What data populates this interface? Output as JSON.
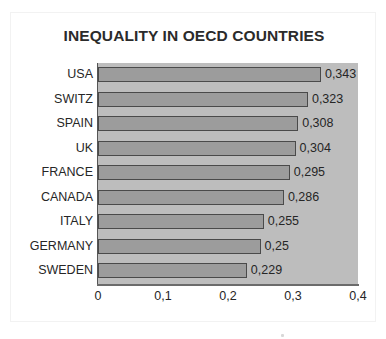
{
  "chart_data": {
    "type": "bar",
    "orientation": "horizontal",
    "title": "INEQUALITY IN OECD COUNTRIES",
    "xlabel": "",
    "ylabel": "",
    "categories": [
      "USA",
      "SWITZ",
      "SPAIN",
      "UK",
      "FRANCE",
      "CANADA",
      "ITALY",
      "GERMANY",
      "SWEDEN"
    ],
    "values": [
      0.343,
      0.323,
      0.308,
      0.304,
      0.295,
      0.286,
      0.255,
      0.25,
      0.229
    ],
    "data_labels": [
      "0,343",
      "0,323",
      "0,308",
      "0,304",
      "0,295",
      "0,286",
      "0,255",
      "0,25",
      "0,229"
    ],
    "xlim": [
      0,
      0.4
    ],
    "x_ticks": [
      0,
      0.1,
      0.2,
      0.3,
      0.4
    ],
    "x_tick_labels": [
      "0",
      "0,1",
      "0,2",
      "0,3",
      "0,4"
    ],
    "grid": false,
    "legend": null,
    "decimal_separator": ",",
    "series": [
      {
        "name": "Gini coefficient",
        "values": [
          0.343,
          0.323,
          0.308,
          0.304,
          0.295,
          0.286,
          0.255,
          0.25,
          0.229
        ]
      }
    ],
    "colors": {
      "bar_fill": "#9c9c9c",
      "bar_border": "#4a4a4a",
      "plot_background": "#bdbdbd",
      "chart_background": "#ffffff",
      "text": "#262626",
      "axis_line": "#555555"
    }
  }
}
